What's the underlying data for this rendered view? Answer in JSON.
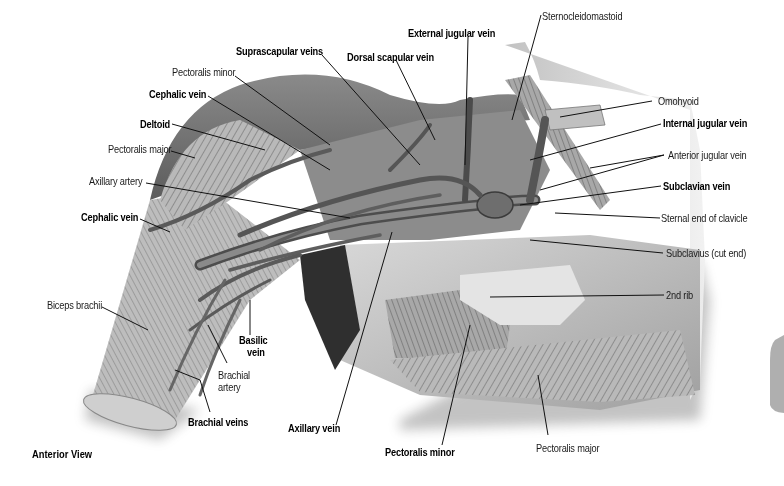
{
  "figure": {
    "view_caption": "Anterior View"
  },
  "labels": [
    {
      "id": "suprascapular-veins",
      "text": "Suprascapular veins",
      "bold": true
    },
    {
      "id": "external-jugular-vein",
      "text": "External jugular vein",
      "bold": true
    },
    {
      "id": "sternocleidomastoid",
      "text": "Sternocleidomastoid",
      "bold": false
    },
    {
      "id": "dorsal-scapular-vein",
      "text": "Dorsal scapular vein",
      "bold": true
    },
    {
      "id": "pectoralis-minor-top",
      "text": "Pectoralis minor",
      "bold": false
    },
    {
      "id": "cephalic-vein-top",
      "text": "Cephalic vein",
      "bold": true
    },
    {
      "id": "deltoid",
      "text": "Deltoid",
      "bold": true
    },
    {
      "id": "pectoralis-major-top",
      "text": "Pectoralis major",
      "bold": false
    },
    {
      "id": "axillary-artery",
      "text": "Axillary artery",
      "bold": false
    },
    {
      "id": "cephalic-vein-lower",
      "text": "Cephalic vein",
      "bold": true
    },
    {
      "id": "omohyoid",
      "text": "Omohyoid",
      "bold": false
    },
    {
      "id": "internal-jugular-vein",
      "text": "Internal jugular vein",
      "bold": true
    },
    {
      "id": "anterior-jugular-vein",
      "text": "Anterior jugular vein",
      "bold": false
    },
    {
      "id": "subclavian-vein",
      "text": "Subclavian vein",
      "bold": true
    },
    {
      "id": "sternal-end-of-clavicle",
      "text": "Sternal end of clavicle",
      "bold": false
    },
    {
      "id": "subclavius-cut-end",
      "text": "Subclavius (cut end)",
      "bold": false
    },
    {
      "id": "second-rib",
      "text": "2nd rib",
      "bold": false
    },
    {
      "id": "biceps-brachii",
      "text": "Biceps brachii",
      "bold": false
    },
    {
      "id": "basilic-vein",
      "text": "Basilic vein",
      "bold": true
    },
    {
      "id": "brachial-artery",
      "text": "Brachial artery",
      "bold": false
    },
    {
      "id": "brachial-veins",
      "text": "Brachial veins",
      "bold": true
    },
    {
      "id": "axillary-vein",
      "text": "Axillary vein",
      "bold": true
    },
    {
      "id": "pectoralis-minor-bottom",
      "text": "Pectoralis minor",
      "bold": true
    },
    {
      "id": "pectoralis-major-bottom",
      "text": "Pectoralis major",
      "bold": false
    }
  ],
  "label_lines": {
    "basilic_vein": [
      "Basilic",
      "vein"
    ],
    "brachial_artery": [
      "Brachial",
      "artery"
    ]
  },
  "colors": {
    "background": "#ffffff",
    "label_text": "#1a1a1a",
    "leader_line": "#111111",
    "tissue_light": "#d9d9d9",
    "tissue_mid": "#9a9a9a",
    "tissue_dark": "#3a3a3a"
  }
}
